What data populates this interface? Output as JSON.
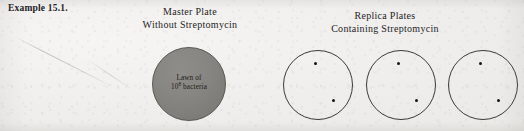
{
  "figure": {
    "label": "Example 15.1.",
    "background_color": "#f2f1ef",
    "ink_color": "#26231f"
  },
  "master": {
    "caption_line1": "Master Plate",
    "caption_line2": "Without Streptomycin",
    "plate": {
      "fill_color": "#878682",
      "stroke_color": "#57564f",
      "label_line1": "Lawn of",
      "label_line2_prefix": "10",
      "label_line2_exponent": "8",
      "label_line2_suffix": " bacteria"
    }
  },
  "replica": {
    "caption_line1": "Replica Plates",
    "caption_line2": "Containing Streptomycin",
    "plates": [
      {
        "name": "replica-plate-1",
        "colony_count": 2,
        "colonies": [
          {
            "x_pct": 44,
            "y_pct": 16
          },
          {
            "x_pct": 70,
            "y_pct": 70
          }
        ]
      },
      {
        "name": "replica-plate-2",
        "colony_count": 2,
        "colonies": [
          {
            "x_pct": 44,
            "y_pct": 16
          },
          {
            "x_pct": 70,
            "y_pct": 70
          }
        ]
      },
      {
        "name": "replica-plate-3",
        "colony_count": 2,
        "colonies": [
          {
            "x_pct": 44,
            "y_pct": 16
          },
          {
            "x_pct": 70,
            "y_pct": 70
          }
        ]
      }
    ],
    "plate_stroke_color": "#3b3a36",
    "colony_color": "#17150f"
  }
}
